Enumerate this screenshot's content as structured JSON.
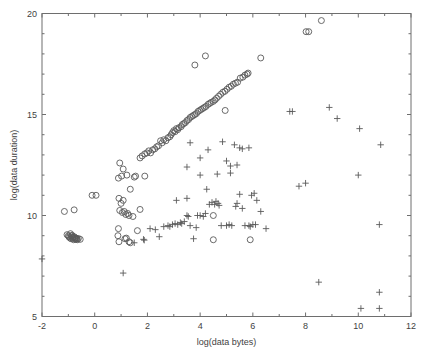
{
  "chart_data": {
    "type": "scatter",
    "title": "",
    "xlabel": "log(data bytes)",
    "ylabel": "log(data duration)",
    "xlim": [
      -2,
      12
    ],
    "ylim": [
      5,
      20
    ],
    "xticks": [
      -2,
      0,
      2,
      4,
      6,
      8,
      10,
      12
    ],
    "xtick_labels": [
      "-2",
      "0",
      "2",
      "4",
      "6",
      "8",
      "10",
      "12"
    ],
    "yticks": [
      5,
      10,
      15,
      20
    ],
    "ytick_labels": [
      "5",
      "10",
      "15",
      "20"
    ],
    "grid": false,
    "legend": "none",
    "marker_colors": {
      "circle": "#5a5a5a",
      "plus": "#5a5a5a"
    },
    "series": [
      {
        "name": "circles",
        "marker": "o",
        "points": [
          [
            -1.05,
            9.05
          ],
          [
            -1.0,
            9.0
          ],
          [
            -0.98,
            8.95
          ],
          [
            -0.95,
            8.9
          ],
          [
            -0.92,
            9.1
          ],
          [
            -0.9,
            8.85
          ],
          [
            -0.88,
            8.98
          ],
          [
            -0.86,
            9.02
          ],
          [
            -0.84,
            8.88
          ],
          [
            -0.82,
            8.92
          ],
          [
            -0.8,
            8.8
          ],
          [
            -0.78,
            8.95
          ],
          [
            -0.76,
            8.86
          ],
          [
            -0.74,
            8.9
          ],
          [
            -0.72,
            8.82
          ],
          [
            -0.7,
            8.88
          ],
          [
            -0.68,
            8.84
          ],
          [
            -0.66,
            8.8
          ],
          [
            -0.62,
            8.86
          ],
          [
            -0.55,
            8.82
          ],
          [
            -1.15,
            10.2
          ],
          [
            -0.78,
            10.28
          ],
          [
            -0.1,
            11.0
          ],
          [
            0.05,
            11.0
          ],
          [
            0.95,
            12.6
          ],
          [
            1.08,
            12.3
          ],
          [
            1.22,
            12.0
          ],
          [
            0.9,
            11.85
          ],
          [
            1.02,
            11.95
          ],
          [
            1.5,
            11.9
          ],
          [
            1.55,
            11.95
          ],
          [
            1.9,
            11.95
          ],
          [
            1.35,
            11.3
          ],
          [
            0.92,
            10.85
          ],
          [
            1.0,
            10.6
          ],
          [
            1.08,
            10.75
          ],
          [
            0.95,
            10.25
          ],
          [
            1.05,
            10.15
          ],
          [
            1.12,
            10.2
          ],
          [
            1.18,
            10.05
          ],
          [
            1.25,
            10.1
          ],
          [
            1.3,
            10.0
          ],
          [
            1.45,
            9.95
          ],
          [
            1.72,
            10.3
          ],
          [
            0.9,
            9.35
          ],
          [
            0.88,
            9.0
          ],
          [
            0.92,
            8.7
          ],
          [
            1.15,
            8.85
          ],
          [
            1.2,
            8.88
          ],
          [
            1.3,
            8.7
          ],
          [
            1.35,
            8.65
          ],
          [
            1.62,
            9.25
          ],
          [
            1.72,
            12.85
          ],
          [
            1.8,
            12.95
          ],
          [
            1.9,
            13.05
          ],
          [
            1.98,
            13.1
          ],
          [
            2.05,
            13.2
          ],
          [
            2.12,
            13.1
          ],
          [
            2.2,
            13.25
          ],
          [
            2.28,
            13.3
          ],
          [
            2.35,
            13.4
          ],
          [
            2.42,
            13.45
          ],
          [
            2.5,
            13.7
          ],
          [
            2.56,
            13.6
          ],
          [
            2.62,
            13.75
          ],
          [
            2.7,
            13.7
          ],
          [
            2.78,
            13.85
          ],
          [
            2.85,
            13.9
          ],
          [
            2.9,
            14.0
          ],
          [
            2.95,
            14.1
          ],
          [
            3.0,
            14.2
          ],
          [
            3.05,
            14.15
          ],
          [
            3.1,
            14.3
          ],
          [
            3.15,
            14.25
          ],
          [
            3.2,
            14.35
          ],
          [
            3.28,
            14.4
          ],
          [
            3.32,
            14.5
          ],
          [
            3.38,
            14.55
          ],
          [
            3.44,
            14.6
          ],
          [
            3.5,
            14.7
          ],
          [
            3.56,
            14.75
          ],
          [
            3.62,
            14.85
          ],
          [
            3.68,
            14.9
          ],
          [
            3.74,
            14.95
          ],
          [
            3.8,
            15.0
          ],
          [
            3.86,
            15.05
          ],
          [
            3.92,
            15.15
          ],
          [
            3.98,
            15.2
          ],
          [
            4.04,
            15.25
          ],
          [
            4.1,
            15.3
          ],
          [
            4.16,
            15.35
          ],
          [
            4.22,
            15.4
          ],
          [
            4.3,
            15.5
          ],
          [
            4.36,
            15.55
          ],
          [
            4.42,
            15.6
          ],
          [
            4.5,
            15.65
          ],
          [
            4.56,
            15.72
          ],
          [
            4.62,
            15.8
          ],
          [
            4.7,
            15.9
          ],
          [
            4.78,
            16.0
          ],
          [
            4.86,
            16.1
          ],
          [
            4.94,
            16.15
          ],
          [
            5.02,
            16.25
          ],
          [
            5.1,
            16.35
          ],
          [
            5.18,
            16.4
          ],
          [
            5.26,
            16.5
          ],
          [
            5.34,
            16.55
          ],
          [
            5.42,
            16.6
          ],
          [
            5.52,
            16.8
          ],
          [
            5.62,
            16.85
          ],
          [
            5.7,
            16.95
          ],
          [
            5.78,
            17.0
          ],
          [
            5.82,
            17.05
          ],
          [
            4.95,
            15.2
          ],
          [
            3.8,
            17.45
          ],
          [
            4.2,
            17.9
          ],
          [
            6.3,
            17.8
          ],
          [
            8.02,
            19.1
          ],
          [
            8.12,
            19.1
          ],
          [
            8.6,
            19.65
          ],
          [
            4.5,
            8.8
          ],
          [
            5.9,
            8.8
          ],
          [
            4.5,
            10.0
          ]
        ]
      },
      {
        "name": "plus",
        "marker": "+",
        "points": [
          [
            -2.0,
            7.85
          ],
          [
            1.08,
            7.15
          ],
          [
            1.5,
            8.65
          ],
          [
            1.85,
            8.82
          ],
          [
            1.88,
            8.78
          ],
          [
            2.1,
            9.35
          ],
          [
            2.3,
            9.3
          ],
          [
            2.45,
            8.95
          ],
          [
            2.62,
            9.45
          ],
          [
            2.78,
            9.5
          ],
          [
            2.85,
            9.45
          ],
          [
            2.95,
            9.55
          ],
          [
            3.05,
            9.6
          ],
          [
            3.15,
            9.55
          ],
          [
            3.25,
            9.65
          ],
          [
            3.3,
            9.6
          ],
          [
            3.4,
            9.7
          ],
          [
            3.5,
            10.0
          ],
          [
            3.55,
            9.95
          ],
          [
            3.62,
            9.5
          ],
          [
            3.75,
            8.85
          ],
          [
            3.85,
            9.4
          ],
          [
            3.9,
            10.0
          ],
          [
            4.0,
            10.0
          ],
          [
            4.12,
            9.95
          ],
          [
            4.2,
            10.1
          ],
          [
            4.35,
            10.55
          ],
          [
            4.45,
            10.65
          ],
          [
            4.55,
            10.55
          ],
          [
            4.6,
            10.7
          ],
          [
            4.68,
            10.6
          ],
          [
            4.72,
            10.5
          ],
          [
            4.8,
            9.5
          ],
          [
            5.0,
            9.5
          ],
          [
            5.1,
            9.55
          ],
          [
            5.2,
            9.5
          ],
          [
            5.35,
            10.45
          ],
          [
            5.4,
            10.6
          ],
          [
            5.5,
            11.05
          ],
          [
            5.6,
            10.35
          ],
          [
            5.7,
            9.5
          ],
          [
            5.85,
            9.5
          ],
          [
            5.9,
            9.45
          ],
          [
            3.5,
            10.85
          ],
          [
            3.1,
            10.75
          ],
          [
            4.25,
            11.3
          ],
          [
            4.0,
            12.0
          ],
          [
            3.5,
            12.4
          ],
          [
            3.62,
            13.6
          ],
          [
            4.0,
            12.85
          ],
          [
            4.3,
            13.25
          ],
          [
            4.85,
            13.65
          ],
          [
            5.0,
            12.7
          ],
          [
            4.65,
            12.05
          ],
          [
            5.15,
            12.1
          ],
          [
            5.15,
            12.45
          ],
          [
            5.3,
            13.5
          ],
          [
            5.4,
            12.5
          ],
          [
            5.5,
            13.35
          ],
          [
            5.6,
            13.3
          ],
          [
            5.85,
            13.35
          ],
          [
            5.95,
            11.0
          ],
          [
            6.05,
            11.1
          ],
          [
            6.15,
            10.75
          ],
          [
            6.3,
            10.2
          ],
          [
            6.5,
            9.35
          ],
          [
            6.0,
            9.55
          ],
          [
            6.1,
            9.55
          ],
          [
            7.4,
            15.15
          ],
          [
            7.5,
            15.15
          ],
          [
            8.9,
            15.35
          ],
          [
            9.2,
            14.8
          ],
          [
            10.05,
            14.3
          ],
          [
            10.85,
            13.5
          ],
          [
            7.75,
            11.45
          ],
          [
            8.0,
            11.6
          ],
          [
            10.0,
            12.0
          ],
          [
            10.8,
            9.55
          ],
          [
            8.5,
            6.7
          ],
          [
            10.1,
            5.4
          ],
          [
            10.8,
            5.4
          ],
          [
            10.8,
            6.2
          ]
        ]
      }
    ]
  },
  "axes": {
    "x_title": "log(data bytes)",
    "y_title": "log(data duration)"
  }
}
